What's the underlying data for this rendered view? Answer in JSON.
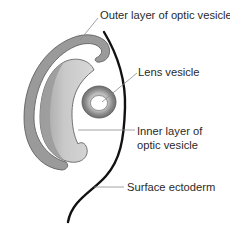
{
  "diagram": {
    "labels": {
      "outer_layer": "Outer layer of optic vesicle",
      "lens_vesicle": "Lens vesicle",
      "inner_layer_line1": "Inner layer of",
      "inner_layer_line2": "optic vesicle",
      "surface_ectoderm": "Surface ectoderm"
    },
    "colors": {
      "outer_layer_fill": "#9a9a9a",
      "inner_layer_fill": "#a8a8a8",
      "inner_layer_highlight": "#d6d6d6",
      "lens_ring_dark": "#6e6e6e",
      "lens_ring_light": "#bdbdbd",
      "lens_cavity": "#ffffff",
      "ectoderm_line": "#111111",
      "leader_line": "#8a8a8a",
      "outline": "#555555"
    }
  }
}
